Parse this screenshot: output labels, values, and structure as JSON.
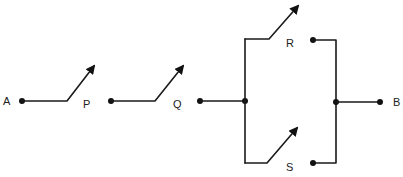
{
  "diagram": {
    "type": "switch-circuit",
    "terminals": {
      "start": "A",
      "end": "B"
    },
    "switches": [
      {
        "label": "P",
        "state": "open",
        "arrangement": "series"
      },
      {
        "label": "Q",
        "state": "open",
        "arrangement": "series"
      },
      {
        "label": "R",
        "state": "open",
        "arrangement": "parallel-upper"
      },
      {
        "label": "S",
        "state": "open",
        "arrangement": "parallel-lower"
      }
    ],
    "colors": {
      "wire": "#1a1a1a",
      "background": "#ffffff"
    }
  }
}
